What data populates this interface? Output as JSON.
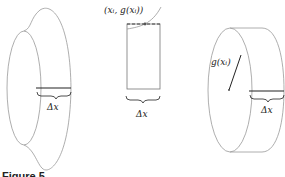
{
  "figure": {
    "caption": "Figure 5",
    "panels": [
      {
        "id": "solid-of-revolution",
        "description": "Solid of revolution with a slice of width Δx",
        "labels": {
          "width": "Δx"
        }
      },
      {
        "id": "rectangle-slice",
        "description": "Rectangle under curve with sample point",
        "labels": {
          "point": "(x_i, g(x_i))",
          "width": "Δx"
        },
        "point_label_display": "(xᵢ, g(xᵢ))"
      },
      {
        "id": "disk",
        "description": "Disk of radius g(x_i) and thickness Δx",
        "labels": {
          "radius": "g(xᵢ)",
          "width": "Δx"
        }
      }
    ]
  }
}
